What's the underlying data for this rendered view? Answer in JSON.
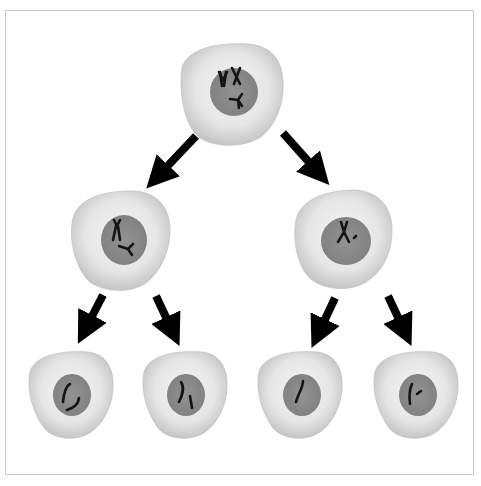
{
  "diagram": {
    "title": "",
    "colors": {
      "cell_body_light": "#f2f2f2",
      "cell_body_mid": "#d9d9d9",
      "cell_body_edge": "#b8b8b8",
      "nucleus": "#8c8c8c",
      "nucleus_edge": "#7a7a7a",
      "chromosome": "#141414",
      "arrow": "#000000",
      "frame": "#c8c8c8"
    },
    "cells": [
      {
        "id": "parent",
        "level": 0,
        "chromosome_count": 4,
        "chromosomes": "replicated-pairs"
      },
      {
        "id": "daughter-left",
        "level": 1,
        "chromosome_count": 2,
        "chromosomes": "replicated"
      },
      {
        "id": "daughter-right",
        "level": 1,
        "chromosome_count": 2,
        "chromosomes": "replicated"
      },
      {
        "id": "gamete-1",
        "level": 2,
        "chromosome_count": 2,
        "chromosomes": "single"
      },
      {
        "id": "gamete-2",
        "level": 2,
        "chromosome_count": 2,
        "chromosomes": "single"
      },
      {
        "id": "gamete-3",
        "level": 2,
        "chromosome_count": 1,
        "chromosomes": "single"
      },
      {
        "id": "gamete-4",
        "level": 2,
        "chromosome_count": 2,
        "chromosomes": "single"
      }
    ],
    "arrows": [
      {
        "from": "parent",
        "to": "daughter-left"
      },
      {
        "from": "parent",
        "to": "daughter-right"
      },
      {
        "from": "daughter-left",
        "to": "gamete-1"
      },
      {
        "from": "daughter-left",
        "to": "gamete-2"
      },
      {
        "from": "daughter-right",
        "to": "gamete-3"
      },
      {
        "from": "daughter-right",
        "to": "gamete-4"
      }
    ]
  }
}
